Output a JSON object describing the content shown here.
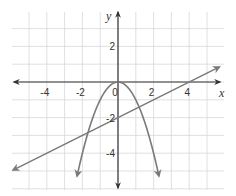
{
  "chart_data": {
    "type": "line",
    "title": "",
    "xlabel": "x",
    "ylabel": "y",
    "xlim": [
      -6,
      6
    ],
    "ylim": [
      -6,
      4
    ],
    "grid": true,
    "x_ticks": [
      -4,
      -2,
      0,
      2,
      4
    ],
    "y_ticks": [
      2,
      -2,
      -4
    ],
    "tick_labels": {
      "x": [
        "-4",
        "-2",
        "0",
        "2",
        "4"
      ],
      "y": [
        "2",
        "-2",
        "-4"
      ]
    },
    "series": [
      {
        "name": "parabola",
        "equation": "y = -x^2",
        "x": [
          -2.3,
          -2,
          -1.5,
          -1,
          -0.5,
          0,
          0.5,
          1,
          1.5,
          2,
          2.3
        ],
        "values": [
          -5.29,
          -4,
          -2.25,
          -1,
          -0.25,
          0,
          -0.25,
          -1,
          -2.25,
          -4,
          -5.29
        ],
        "color": "#7a7a7a",
        "arrows": "both ends"
      },
      {
        "name": "line",
        "equation": "y = 0.5x - 2",
        "x": [
          -5.9,
          0,
          4,
          5.7
        ],
        "values": [
          -4.95,
          -2,
          0,
          0.85
        ],
        "color": "#7a7a7a",
        "arrows": "both ends"
      }
    ],
    "intersections": [
      {
        "x": -1.69,
        "y": -2.84
      },
      {
        "x": 1.19,
        "y": -1.41
      }
    ]
  },
  "colors": {
    "axis": "#333333",
    "grid": "#d8d8d8",
    "curve": "#7a7a7a"
  }
}
